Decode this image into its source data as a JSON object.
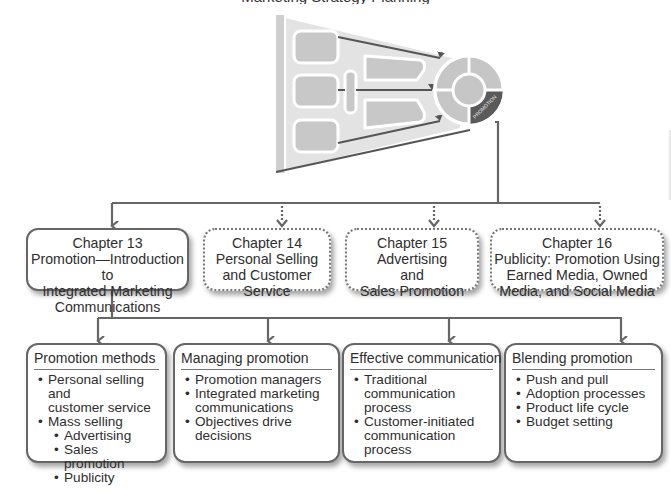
{
  "header": {
    "title_partial": "Marketing Strategy Planning"
  },
  "funnel": {
    "wheel_segment_label": "PROMOTION",
    "colors": {
      "funnel_fill": "#e4e4e4",
      "block_fill": "#c9c9c9",
      "block_border": "#ffffff",
      "arrow": "#555555",
      "highlight_segment": "#5a5a5a"
    }
  },
  "chapters": [
    {
      "number": "Chapter 13",
      "lines": [
        "Promotion—Introduction to",
        "Integrated Marketing",
        "Communications"
      ],
      "style": "solid"
    },
    {
      "number": "Chapter 14",
      "lines": [
        "Personal Selling",
        "and Customer",
        "Service"
      ],
      "style": "dotted"
    },
    {
      "number": "Chapter 15",
      "lines": [
        "Advertising",
        "and",
        "Sales Promotion"
      ],
      "style": "dotted"
    },
    {
      "number": "Chapter 16",
      "lines": [
        "Publicity: Promotion Using",
        "Earned Media, Owned",
        "Media, and Social Media"
      ],
      "style": "dotted"
    }
  ],
  "topics": [
    {
      "heading": "Promotion methods",
      "items": [
        {
          "lines": [
            "Personal selling and",
            "customer service"
          ],
          "level": 1
        },
        {
          "lines": [
            "Mass selling"
          ],
          "level": 1
        },
        {
          "lines": [
            "Advertising"
          ],
          "level": 2
        },
        {
          "lines": [
            "Sales promotion"
          ],
          "level": 2
        },
        {
          "lines": [
            "Publicity"
          ],
          "level": 2
        }
      ]
    },
    {
      "heading": "Managing promotion",
      "items": [
        {
          "lines": [
            "Promotion managers"
          ],
          "level": 1
        },
        {
          "lines": [
            "Integrated marketing",
            "communications"
          ],
          "level": 1
        },
        {
          "lines": [
            "Objectives drive",
            "decisions"
          ],
          "level": 1
        }
      ]
    },
    {
      "heading": "Effective communication",
      "items": [
        {
          "lines": [
            "Traditional",
            "communication process"
          ],
          "level": 1
        },
        {
          "lines": [
            "Customer-initiated",
            "communication process"
          ],
          "level": 1
        }
      ]
    },
    {
      "heading": "Blending promotion",
      "items": [
        {
          "lines": [
            "Push and pull"
          ],
          "level": 1
        },
        {
          "lines": [
            "Adoption processes"
          ],
          "level": 1
        },
        {
          "lines": [
            "Product life cycle"
          ],
          "level": 1
        },
        {
          "lines": [
            "Budget setting"
          ],
          "level": 1
        }
      ]
    }
  ],
  "connectors": {
    "color": "#666666"
  }
}
